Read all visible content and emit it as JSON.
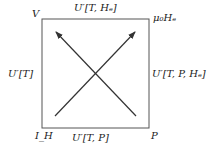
{
  "diagram": {
    "corners": {
      "top_left": "V",
      "top_right": "μ₀Hₑ",
      "bottom_left": "I_H",
      "bottom_right": "P"
    },
    "edges": {
      "top": "U′[T, Hₑ]",
      "left": "U′[T]",
      "right": "U′[T, P, Hₑ]",
      "bottom": "U′[T, P]"
    },
    "arrows": [
      {
        "from": "bottom-left",
        "to": "top-right"
      },
      {
        "from": "bottom-right",
        "to": "top-left"
      }
    ],
    "colors": {
      "line": "#444444",
      "text": "#222222"
    }
  }
}
